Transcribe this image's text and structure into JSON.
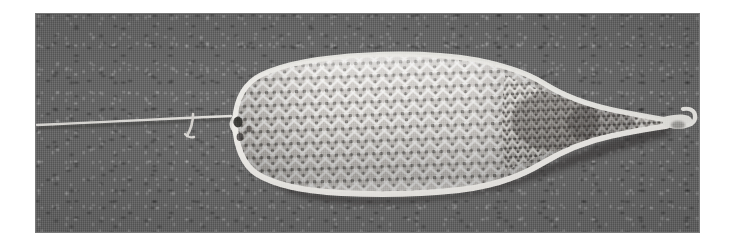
{
  "page": {
    "width": 731,
    "height": 249,
    "background_color": "#ffffff",
    "kind": "scanned-grayscale-photograph"
  },
  "photo": {
    "name": "scanning-electron-micrograph",
    "frame": {
      "left": 35,
      "top": 13,
      "width": 665,
      "height": 220
    },
    "background_color": "#6b6b6b",
    "border_color": "#787878",
    "texture": "mottled-grain-halftone"
  },
  "subject": {
    "label": "braided-mesh-occluder-device",
    "description": "Elongated braided wire-mesh device, bulbous at the left end, widest near the middle, tapering to a narrow neck and small rounded tip at the right end, mounted on a thin delivery wire entering from the left.",
    "highlight_color": "#f2f0ec",
    "shadow_color": "#3a3a3a",
    "mesh": {
      "pattern": "diamond-braid-lattice",
      "cell_width": 7.5,
      "cell_height": 6.5,
      "strand_color": "#e8e6e2",
      "opening_color": "#555150"
    },
    "body": {
      "left_x": 225,
      "right_tip_x": 683,
      "top_y": 55,
      "bottom_y": 193,
      "widest_x": 390
    },
    "delivery_wire": {
      "name": "delivery-wire",
      "from_x": 38,
      "to_x": 228,
      "y": 118,
      "color": "#e6e4e0",
      "hook_x": 193
    },
    "distal_tip": {
      "name": "distal-marker-tip",
      "x": 660,
      "y": 110,
      "color": "#efeeea"
    },
    "eyelet": {
      "name": "proximal-eyelet",
      "x": 236,
      "y": 120,
      "color": "#2f2d2c"
    }
  }
}
